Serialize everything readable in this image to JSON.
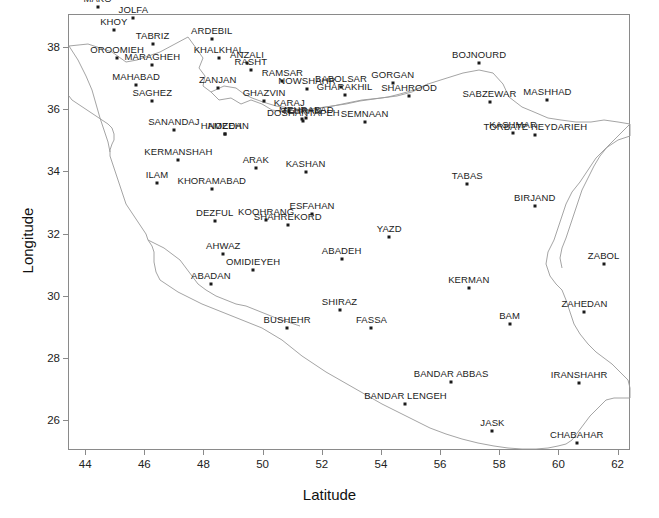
{
  "chart_data": {
    "type": "scatter",
    "title": "",
    "xlabel": "Latitude",
    "ylabel": "Longitude",
    "xlim": [
      43.42,
      62.42
    ],
    "ylim": [
      25.05,
      39.05
    ],
    "xticks": [
      44,
      46,
      48,
      50,
      52,
      54,
      56,
      58,
      60,
      62
    ],
    "yticks": [
      26,
      28,
      30,
      32,
      34,
      36,
      38
    ],
    "grid": false,
    "legend": null,
    "marker": "filled-square",
    "marker_color": "#1a1a1a",
    "outline_color": "#8a8a8a",
    "annotation_note": "Synoptic stations of Iran; several labels overlap in dense clusters",
    "points": [
      {
        "name": "MAKO",
        "x": 44.42,
        "y": 39.29
      },
      {
        "name": "PARSABADMOGHAN",
        "x": 47.88,
        "y": 39.65
      },
      {
        "name": "JOLFA",
        "x": 45.63,
        "y": 38.93
      },
      {
        "name": "KHOY",
        "x": 44.97,
        "y": 38.55
      },
      {
        "name": "TABRIZ",
        "x": 46.28,
        "y": 38.08
      },
      {
        "name": "ARDEBIL",
        "x": 48.28,
        "y": 38.25
      },
      {
        "name": "OROOMIEH",
        "x": 45.08,
        "y": 37.65
      },
      {
        "name": "MARAGHEH",
        "x": 46.27,
        "y": 37.4
      },
      {
        "name": "KHALKHAL",
        "x": 48.52,
        "y": 37.63
      },
      {
        "name": "ANZALI",
        "x": 49.47,
        "y": 37.47
      },
      {
        "name": "RASHT",
        "x": 49.6,
        "y": 37.25
      },
      {
        "name": "MAHABAD",
        "x": 45.72,
        "y": 36.77
      },
      {
        "name": "SAGHEZ",
        "x": 46.27,
        "y": 36.25
      },
      {
        "name": "ZANJAN",
        "x": 48.48,
        "y": 36.68
      },
      {
        "name": "RAMSAR",
        "x": 50.67,
        "y": 36.9
      },
      {
        "name": "NOWSHAHR",
        "x": 51.5,
        "y": 36.65
      },
      {
        "name": "BABOLSAR",
        "x": 52.65,
        "y": 36.72
      },
      {
        "name": "GHARAKHIL",
        "x": 52.77,
        "y": 36.45
      },
      {
        "name": "GORGAN",
        "x": 54.4,
        "y": 36.85
      },
      {
        "name": "SHAHROOD",
        "x": 54.95,
        "y": 36.42
      },
      {
        "name": "BOJNOURD",
        "x": 57.32,
        "y": 37.47
      },
      {
        "name": "GHAZVIN",
        "x": 50.05,
        "y": 36.25
      },
      {
        "name": "KARAJ",
        "x": 50.9,
        "y": 35.92
      },
      {
        "name": "TEHRAN",
        "x": 51.32,
        "y": 35.68
      },
      {
        "name": "DOSHANTAPEH",
        "x": 51.38,
        "y": 35.6
      },
      {
        "name": "MEHRABAD",
        "x": 51.48,
        "y": 35.7
      },
      {
        "name": "SEMNAAN",
        "x": 53.45,
        "y": 35.58
      },
      {
        "name": "SABZEWAR",
        "x": 57.67,
        "y": 36.22
      },
      {
        "name": "MASHHAD",
        "x": 59.63,
        "y": 36.28
      },
      {
        "name": "KASHMAR",
        "x": 58.47,
        "y": 35.23
      },
      {
        "name": "TORBATE HEYDARIEH",
        "x": 59.22,
        "y": 35.18
      },
      {
        "name": "SANANDAJ",
        "x": 47.0,
        "y": 35.33
      },
      {
        "name": "HAMEDAN",
        "x": 48.72,
        "y": 35.2
      },
      {
        "name": "NOZEH",
        "x": 48.72,
        "y": 35.2
      },
      {
        "name": "KERMANSHAH",
        "x": 47.15,
        "y": 34.35
      },
      {
        "name": "ARAK",
        "x": 49.77,
        "y": 34.1
      },
      {
        "name": "KASHAN",
        "x": 51.45,
        "y": 33.98
      },
      {
        "name": "ILAM",
        "x": 46.43,
        "y": 33.63
      },
      {
        "name": "KHORAMABAD",
        "x": 48.28,
        "y": 33.43
      },
      {
        "name": "TABAS",
        "x": 56.92,
        "y": 33.6
      },
      {
        "name": "BIRJAND",
        "x": 59.2,
        "y": 32.87
      },
      {
        "name": "DEZFUL",
        "x": 48.38,
        "y": 32.4
      },
      {
        "name": "KOOHRANG",
        "x": 50.12,
        "y": 32.43
      },
      {
        "name": "SHAHREKORD",
        "x": 50.85,
        "y": 32.28
      },
      {
        "name": "ESFAHAN",
        "x": 51.67,
        "y": 32.62
      },
      {
        "name": "YAZD",
        "x": 54.28,
        "y": 31.9
      },
      {
        "name": "ZABOL",
        "x": 61.53,
        "y": 31.03
      },
      {
        "name": "AHWAZ",
        "x": 48.67,
        "y": 31.33
      },
      {
        "name": "OMIDIEYEH",
        "x": 49.68,
        "y": 30.83
      },
      {
        "name": "ABADAN",
        "x": 48.25,
        "y": 30.37
      },
      {
        "name": "ABADEH",
        "x": 52.67,
        "y": 31.18
      },
      {
        "name": "KERMAN",
        "x": 56.97,
        "y": 30.25
      },
      {
        "name": "SHIRAZ",
        "x": 52.6,
        "y": 29.53
      },
      {
        "name": "BUSHEHR",
        "x": 50.83,
        "y": 28.98
      },
      {
        "name": "FASSA",
        "x": 53.68,
        "y": 28.97
      },
      {
        "name": "BAM",
        "x": 58.35,
        "y": 29.1
      },
      {
        "name": "ZAHEDAN",
        "x": 60.88,
        "y": 29.47
      },
      {
        "name": "BANDAR ABBAS",
        "x": 56.37,
        "y": 27.22
      },
      {
        "name": "IRANSHAHR",
        "x": 60.7,
        "y": 27.2
      },
      {
        "name": "BANDAR LENGEH",
        "x": 54.83,
        "y": 26.53
      },
      {
        "name": "JASK",
        "x": 57.77,
        "y": 25.65
      },
      {
        "name": "CHABAHAR",
        "x": 60.62,
        "y": 25.28
      }
    ]
  }
}
